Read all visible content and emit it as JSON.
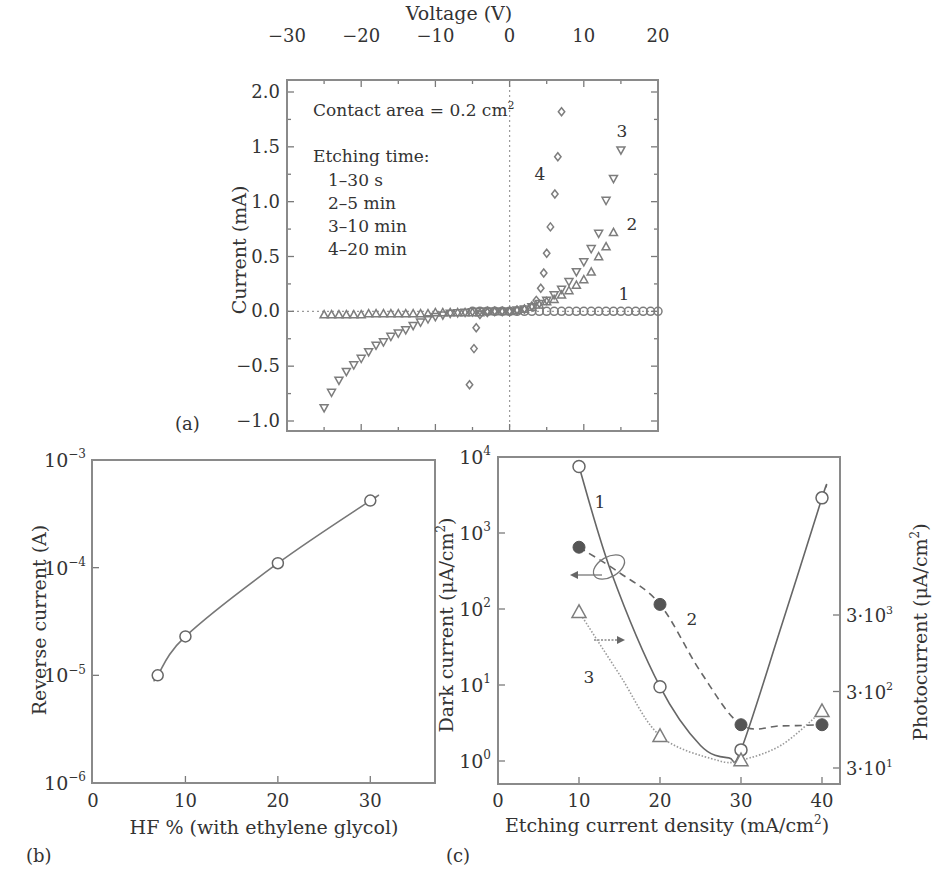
{
  "colors": {
    "ink": "#333333",
    "axis": "#8a8a8a",
    "marker": "#7d7d7d",
    "curve": "#777777",
    "filled": "#555555"
  },
  "panels": {
    "a": {
      "label": "(a)",
      "title_axis": "Voltage (V)",
      "ylabel": "Current (mA)",
      "annotation_contact": "Contact area = 0.2 cm",
      "annotation_contact_sup": "2",
      "annotation_etching_title": "Etching time:",
      "legend_lines": [
        "1–30 s",
        "2–5 min",
        "3–10 min",
        "4–20 min"
      ],
      "curve_labels": [
        "1",
        "2",
        "3",
        "4"
      ]
    },
    "b": {
      "label": "(b)",
      "xlabel": "HF % (with ethylene glycol)",
      "ylabel": "Reverse current (A)"
    },
    "c": {
      "label": "(c)",
      "xlabel": "Etching current density (mA/cm",
      "xlabel_sup": "2",
      "xlabel_end": ")",
      "ylabel_left": "Dark current (μA/cm",
      "ylabel_right": "Photocurrent (μA/cm",
      "ylabel_sup": "2",
      "ylabel_end": ")",
      "curve_labels": [
        "1",
        "2",
        "3"
      ]
    }
  },
  "chart_data": [
    {
      "panel": "a",
      "type": "scatter",
      "title": "",
      "xlabel": "Voltage (V)",
      "ylabel": "Current (mA)",
      "xlim": [
        -30,
        20
      ],
      "ylim": [
        -1.0,
        2.0
      ],
      "xticks": [
        -30,
        -20,
        -10,
        0,
        10,
        20
      ],
      "yticks": [
        -1.0,
        -0.5,
        0.0,
        0.5,
        1.0,
        1.5,
        2.0
      ],
      "xtick_labels": [
        "−30",
        "−20",
        "−10",
        "0",
        "10",
        "20"
      ],
      "ytick_labels": [
        "−1.0",
        "−0.5",
        "0.0",
        "0.5",
        "1.0",
        "1.5",
        "2.0"
      ],
      "x_axis_position": "top",
      "guides": [
        "dotted line at x=0",
        "dotted line at y=0"
      ],
      "annotations": [
        "Contact area = 0.2 cm²",
        "Etching time:",
        "1–30 s",
        "2–5 min",
        "3–10 min",
        "4–20 min"
      ],
      "series": [
        {
          "name": "1–30 s",
          "label": "1",
          "marker": "circle",
          "x": [
            -5,
            -4,
            -3,
            -2,
            -1,
            0,
            1,
            2,
            3,
            4,
            5,
            6,
            7,
            8,
            9,
            10,
            11,
            12,
            13,
            14,
            15,
            16,
            17,
            18,
            19,
            20
          ],
          "y": [
            0,
            0,
            0,
            0,
            0,
            0,
            0,
            0,
            0,
            0,
            0,
            0,
            0,
            0,
            0,
            0,
            0,
            0,
            0,
            0,
            0,
            0,
            0,
            0,
            0,
            0
          ]
        },
        {
          "name": "2–5 min",
          "label": "2",
          "marker": "triangle-up",
          "x": [
            -25,
            -24,
            -23,
            -22,
            -21,
            -20,
            -19,
            -18,
            -17,
            -16,
            -15,
            -14,
            -13,
            -12,
            -11,
            -10,
            -9,
            -8,
            -7,
            -6,
            -5,
            -4,
            -3,
            -2,
            -1,
            0,
            1,
            2,
            3,
            4,
            5,
            6,
            7,
            8,
            9,
            10,
            11,
            12,
            13,
            14
          ],
          "y": [
            -0.03,
            -0.03,
            -0.03,
            -0.03,
            -0.03,
            -0.03,
            -0.02,
            -0.02,
            -0.02,
            -0.02,
            -0.02,
            -0.02,
            -0.02,
            -0.02,
            -0.02,
            -0.01,
            -0.01,
            -0.01,
            -0.01,
            -0.01,
            -0.01,
            -0.01,
            0,
            0,
            0,
            0,
            0.01,
            0.02,
            0.04,
            0.06,
            0.09,
            0.11,
            0.15,
            0.19,
            0.24,
            0.29,
            0.36,
            0.5,
            0.59,
            0.72
          ]
        },
        {
          "name": "3–10 min",
          "label": "3",
          "marker": "triangle-down",
          "x": [
            -25,
            -24,
            -23,
            -22,
            -21,
            -20,
            -19,
            -18,
            -17,
            -16,
            -15,
            -14,
            -13,
            -12,
            -11,
            -10,
            -9,
            -8,
            -7,
            -6,
            -5,
            -4,
            -3,
            -2,
            -1,
            0,
            1,
            2,
            3,
            4,
            5,
            6,
            7,
            8,
            9,
            10,
            11,
            12,
            13,
            14,
            15
          ],
          "y": [
            -0.88,
            -0.74,
            -0.63,
            -0.55,
            -0.49,
            -0.43,
            -0.37,
            -0.31,
            -0.28,
            -0.23,
            -0.2,
            -0.17,
            -0.13,
            -0.1,
            -0.07,
            -0.05,
            -0.035,
            -0.02,
            -0.015,
            -0.01,
            -0.005,
            0,
            0,
            0,
            0,
            0,
            0.01,
            0.02,
            0.04,
            0.07,
            0.1,
            0.15,
            0.2,
            0.27,
            0.36,
            0.45,
            0.57,
            0.71,
            1.01,
            1.21,
            1.47
          ]
        },
        {
          "name": "4–20 min",
          "label": "4",
          "marker": "diamond",
          "x": [
            -5.4,
            -4.8,
            -4.5,
            -4,
            -3,
            -2,
            -1,
            0,
            1,
            2,
            3,
            3.6,
            4.2,
            4.6,
            5.0,
            5.5,
            6.1,
            6.5,
            7.0
          ],
          "y": [
            -0.67,
            -0.34,
            -0.15,
            -0.03,
            -0.01,
            0,
            0,
            0,
            0.01,
            0.02,
            0.05,
            0.1,
            0.21,
            0.35,
            0.53,
            0.77,
            1.07,
            1.41,
            1.82
          ]
        }
      ]
    },
    {
      "panel": "b",
      "type": "line",
      "title": "",
      "xlabel": "HF % (with ethylene glycol)",
      "ylabel": "Reverse current (A)",
      "xlim": [
        0,
        37
      ],
      "ylim": [
        1e-06,
        0.001
      ],
      "yscale": "log",
      "xticks": [
        0,
        10,
        20,
        30
      ],
      "xtick_labels": [
        "0",
        "10",
        "20",
        "30"
      ],
      "yticks": [
        1e-06,
        1e-05,
        0.0001,
        0.001
      ],
      "ytick_labels": [
        {
          "base": "10",
          "exp": "−6"
        },
        {
          "base": "10",
          "exp": "−5"
        },
        {
          "base": "10",
          "exp": "−4"
        },
        {
          "base": "10",
          "exp": "−3"
        }
      ],
      "series": [
        {
          "name": "Reverse current",
          "marker": "open-circle",
          "line": "solid",
          "x": [
            7,
            10,
            20,
            30
          ],
          "y": [
            1e-05,
            2.3e-05,
            0.00011,
            0.00042
          ]
        }
      ]
    },
    {
      "panel": "c",
      "type": "line",
      "title": "",
      "xlabel": "Etching current density (mA/cm²)",
      "ylabel": "Dark current (μA/cm²)",
      "ylabel_right": "Photocurrent (μA/cm²)",
      "xlim": [
        0,
        43
      ],
      "ylim": [
        0.5,
        10000
      ],
      "yscale": "log",
      "xticks": [
        0,
        10,
        20,
        30,
        40
      ],
      "xtick_labels": [
        "0",
        "10",
        "20",
        "30",
        "40"
      ],
      "yticks": [
        1,
        10,
        100,
        1000,
        10000
      ],
      "ytick_labels": [
        {
          "base": "10",
          "exp": "0"
        },
        {
          "base": "10",
          "exp": "1"
        },
        {
          "base": "10",
          "exp": "2"
        },
        {
          "base": "10",
          "exp": "3"
        },
        {
          "base": "10",
          "exp": "4"
        }
      ],
      "yticks_right": [
        30,
        300,
        3000
      ],
      "ytick_labels_right": [
        {
          "base": "3·10",
          "exp": "1"
        },
        {
          "base": "3·10",
          "exp": "2"
        },
        {
          "base": "3·10",
          "exp": "3"
        }
      ],
      "annotations": [
        "ellipse with arrow pointing left around curves 1 & 2 (left axis)",
        "arrow pointing right from curve 3 (right axis)"
      ],
      "series": [
        {
          "name": "1",
          "axis": "left",
          "marker": "open-circle",
          "line": "solid",
          "x": [
            10,
            20,
            30,
            40
          ],
          "y": [
            7500,
            9.5,
            1.4,
            2900
          ]
        },
        {
          "name": "2",
          "axis": "left",
          "marker": "filled-circle",
          "line": "dashed",
          "x": [
            10,
            20,
            30,
            40
          ],
          "y": [
            650,
            115,
            3.0,
            3.0
          ]
        },
        {
          "name": "3",
          "axis": "right",
          "marker": "open-triangle",
          "line": "dotted",
          "x": [
            10,
            20,
            30,
            40
          ],
          "y": [
            3300,
            79,
            38,
            167
          ]
        }
      ]
    }
  ]
}
